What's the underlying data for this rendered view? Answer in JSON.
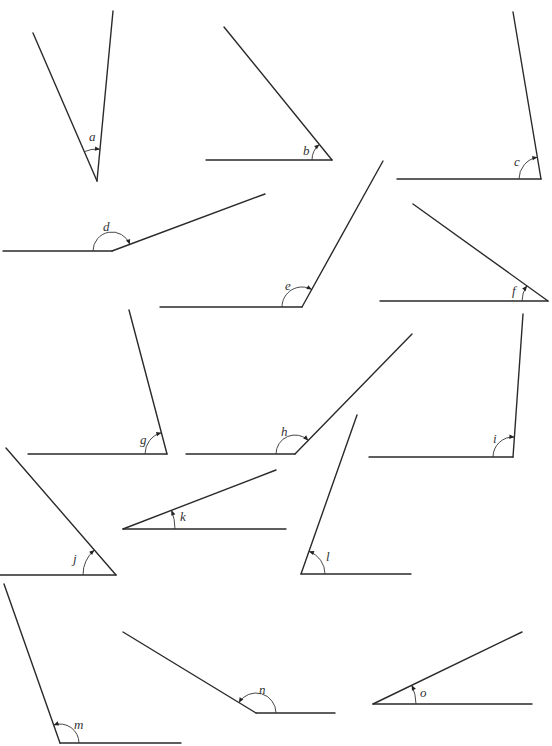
{
  "diagram": {
    "type": "angle-identification-worksheet",
    "angles": [
      {
        "label": "a",
        "vertex": [
          97,
          181
        ],
        "arm1": [
          33,
          33
        ],
        "arm2": [
          113,
          11
        ],
        "label_pos": [
          89,
          141
        ],
        "radius": 32
      },
      {
        "label": "b",
        "vertex": [
          332,
          160
        ],
        "arm1": [
          206,
          160
        ],
        "arm2": [
          224,
          27
        ],
        "label_pos": [
          303,
          155
        ],
        "radius": 20
      },
      {
        "label": "c",
        "vertex": [
          541,
          179
        ],
        "arm1": [
          397,
          179
        ],
        "arm2": [
          513,
          12
        ],
        "label_pos": [
          514,
          166
        ],
        "radius": 22
      },
      {
        "label": "d",
        "vertex": [
          112,
          251
        ],
        "arm1": [
          3,
          251
        ],
        "arm2": [
          265,
          194
        ],
        "label_pos": [
          103,
          231
        ],
        "radius": 19
      },
      {
        "label": "e",
        "vertex": [
          302,
          307
        ],
        "arm1": [
          160,
          307
        ],
        "arm2": [
          383,
          161
        ],
        "label_pos": [
          285,
          290
        ],
        "radius": 20
      },
      {
        "label": "f",
        "vertex": [
          548,
          301
        ],
        "arm1": [
          380,
          301
        ],
        "arm2": [
          413,
          204
        ],
        "label_pos": [
          512,
          295
        ],
        "radius": 26
      },
      {
        "label": "g",
        "vertex": [
          167,
          454
        ],
        "arm1": [
          28,
          454
        ],
        "arm2": [
          129,
          310
        ],
        "label_pos": [
          140,
          444
        ],
        "radius": 22
      },
      {
        "label": "h",
        "vertex": [
          295,
          454
        ],
        "arm1": [
          186,
          454
        ],
        "arm2": [
          412,
          334
        ],
        "label_pos": [
          281,
          436
        ],
        "radius": 19
      },
      {
        "label": "i",
        "vertex": [
          513,
          457
        ],
        "arm1": [
          369,
          457
        ],
        "arm2": [
          523,
          314
        ],
        "label_pos": [
          493,
          443
        ],
        "radius": 20
      },
      {
        "label": "j",
        "vertex": [
          116,
          575
        ],
        "arm1": [
          0,
          575
        ],
        "arm2": [
          6,
          448
        ],
        "label_pos": [
          73,
          563
        ],
        "radius": 33
      },
      {
        "label": "k",
        "vertex": [
          123,
          529
        ],
        "arm1": [
          286,
          529
        ],
        "arm2": [
          276,
          470
        ],
        "label_pos": [
          180,
          521
        ],
        "radius": 52
      },
      {
        "label": "l",
        "vertex": [
          301,
          574
        ],
        "arm1": [
          411,
          574
        ],
        "arm2": [
          357,
          415
        ],
        "label_pos": [
          326,
          561
        ],
        "radius": 24
      },
      {
        "label": "m",
        "vertex": [
          60,
          743
        ],
        "arm1": [
          181,
          743
        ],
        "arm2": [
          4,
          584
        ],
        "label_pos": [
          74,
          729
        ],
        "radius": 19
      },
      {
        "label": "n",
        "vertex": [
          256,
          713
        ],
        "arm1": [
          335,
          713
        ],
        "arm2": [
          123,
          632
        ],
        "label_pos": [
          259,
          694
        ],
        "radius": 20
      },
      {
        "label": "o",
        "vertex": [
          373,
          704
        ],
        "arm1": [
          532,
          704
        ],
        "arm2": [
          522,
          632
        ],
        "label_pos": [
          420,
          697
        ],
        "radius": 43
      }
    ],
    "stroke_color": "#2a2a2a",
    "background": "#ffffff"
  }
}
